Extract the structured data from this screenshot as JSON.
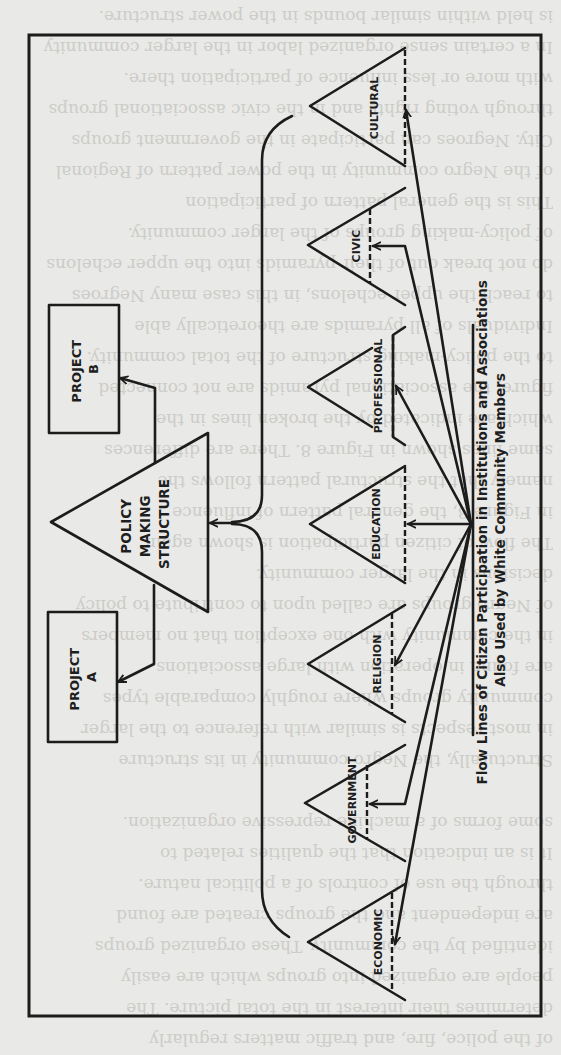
{
  "diagram": {
    "caption": {
      "line1": "Flow Lines of Citizen Participation in Institutions and Associations",
      "line2": "Also Used by White Community Members"
    },
    "policy": {
      "line1": "POLICY",
      "line2": "MAKING",
      "line3": "STRUCTURE"
    },
    "projects": [
      {
        "line1": "PROJECT",
        "line2": "B"
      },
      {
        "line1": "PROJECT",
        "line2": "A"
      }
    ],
    "institutions": [
      {
        "label": "CULTURAL"
      },
      {
        "label": "CIVIC"
      },
      {
        "label": "PROFESSIONAL"
      },
      {
        "label": "EDUCATION"
      },
      {
        "label": "RELIGION"
      },
      {
        "label": "GOVERNMENT"
      },
      {
        "label": "ECONOMIC"
      }
    ],
    "orientation": "rotated 90 degrees counter-clockwise on page"
  },
  "background_text": {
    "lines": [
      "of the police, fire, and traffic matters regularly",
      "determines their interest in the total picture. The",
      "people are organized into groups which are easily",
      "identified by the community. These organized groups",
      "are independent and the groups created are found",
      "through the use of controls of a political nature.",
      "It is an indication that the qualities related to",
      "some forms of a machine repressive organization.",
      "",
      "Structurally, the Negro community in its structure",
      "in most respects is similar with reference to the larger",
      "community groups where roughly comparable types",
      "are found in operation with large associations",
      "in the community with one exception that no members",
      "of Negro groups are called upon to contribute to policy",
      "decisions in the larger community.",
      "The flow of citizen participation is shown again",
      "in Figure 8, the general pattern of influence",
      "namely that the structural pattern follows the",
      "same lines shown in Figure 8. There are differences",
      "which are indicated by the broken lines in the",
      "figure; the associational pyramids are not connected",
      "to the policy-making structure of the total community.",
      "Individuals of all pyramids are theoretically able",
      "to reach the upper echelons, in this case many Negroes",
      "do not break out of their pyramids into the upper echelons",
      "of policy-making groups of the larger community.",
      "This is the general pattern of participation",
      "of the Negro community in the power pattern of Regional",
      "City. Negroes can participate in the government groups",
      "through voting rights and in the civic associational groups",
      "with more or less influence of participation there.",
      "In a certain sense organized labor in the larger community",
      "is held within similar bounds in the power structure."
    ]
  }
}
